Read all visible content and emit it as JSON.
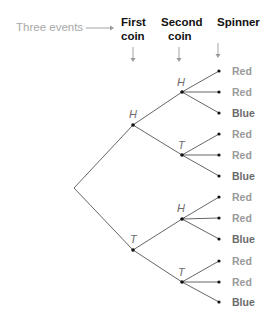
{
  "header": {
    "lead_label": "Three events",
    "columns": [
      {
        "line1": "First",
        "line2": "coin"
      },
      {
        "line1": "Second",
        "line2": "coin"
      },
      {
        "line1": "Spinner",
        "line2": ""
      }
    ]
  },
  "tree": {
    "first_coin": [
      {
        "label": "H",
        "second_coin": [
          {
            "label": "H",
            "spinner": [
              "Red",
              "Red",
              "Blue"
            ]
          },
          {
            "label": "T",
            "spinner": [
              "Red",
              "Red",
              "Blue"
            ]
          }
        ]
      },
      {
        "label": "T",
        "second_coin": [
          {
            "label": "H",
            "spinner": [
              "Red",
              "Red",
              "Blue"
            ]
          },
          {
            "label": "T",
            "spinner": [
              "Red",
              "Red",
              "Blue"
            ]
          }
        ]
      }
    ]
  },
  "labels": {
    "n1": "H",
    "n2": "T",
    "n11": "H",
    "n12": "T",
    "n21": "H",
    "n22": "T",
    "l1": "Red",
    "l2": "Red",
    "l3": "Blue",
    "l4": "Red",
    "l5": "Red",
    "l6": "Blue",
    "l7": "Red",
    "l8": "Red",
    "l9": "Blue",
    "l10": "Red",
    "l11": "Red",
    "l12": "Blue"
  }
}
